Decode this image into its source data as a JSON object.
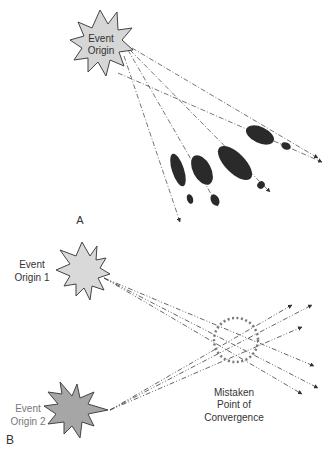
{
  "panel_a": {
    "label": "A",
    "origin": {
      "line1": "Event",
      "line2": "Origin",
      "fill": "#d6d6d6"
    },
    "trajectories": 5,
    "blob_color": "#2a2a2a"
  },
  "panel_b": {
    "label": "B",
    "origin1": {
      "line1": "Event",
      "line2": "Origin 1",
      "fill": "#d9d9d9"
    },
    "origin2": {
      "line1": "Event",
      "line2": "Origin 2",
      "fill": "#a6a6a6"
    },
    "convergence": {
      "line1": "Mistaken",
      "line2": "Point of",
      "line3": "Convergence",
      "circle_color": "#777777"
    }
  },
  "colors": {
    "line": "#555555",
    "outline": "#444444"
  }
}
